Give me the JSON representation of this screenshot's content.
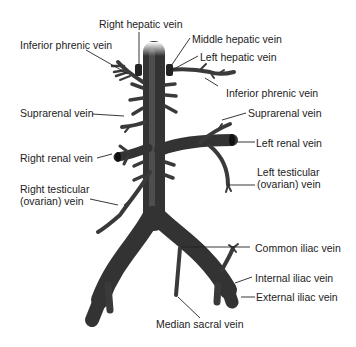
{
  "labels": {
    "right_hepatic": "Right hepatic vein",
    "inferior_phrenic_left": "Inferior phrenic vein",
    "middle_hepatic": "Middle hepatic vein",
    "left_hepatic": "Left hepatic vein",
    "inferior_phrenic_right": "Inferior phrenic vein",
    "suprarenal_left": "Suprarenal vein",
    "suprarenal_right": "Suprarenal vein",
    "left_renal": "Left renal vein",
    "right_renal": "Right renal vein",
    "left_testicular": "Left testicular\n(ovarian) vein",
    "right_testicular": "Right testicular\n(ovarian) vein",
    "common_iliac": "Common iliac vein",
    "internal_iliac": "Internal iliac vein",
    "external_iliac": "External iliac vein",
    "median_sacral": "Median sacral vein"
  },
  "colors": {
    "vein": "#3a3a3a",
    "vein_highlight": "#6a6a6a",
    "leader": "#222222",
    "text": "#222222"
  }
}
